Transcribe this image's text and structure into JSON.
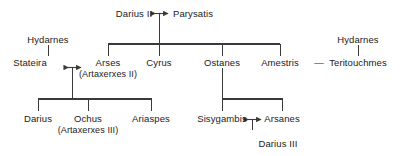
{
  "diagram": {
    "line_color": "#3a3a3a",
    "text_color": "#1a1a1a",
    "background": "#ffffff",
    "marriage_symbol": "double-headed-arrow",
    "sibling_link_symbol": "em-dash"
  },
  "people": {
    "darius_ii": "Darius II",
    "parysatis": "Parysatis",
    "hydarnes_left": "Hydarnes",
    "hydarnes_right": "Hydarnes",
    "stateira": "Stateira",
    "arses": "Arses",
    "arses_alt": "(Artaxerxes II)",
    "cyrus": "Cyrus",
    "ostanes": "Ostanes",
    "amestris": "Amestris",
    "teritouchmes": "Teritouchmes",
    "darius": "Darius",
    "ochus": "Ochus",
    "ochus_alt": "(Artaxerxes III)",
    "ariaspes": "Ariaspes",
    "sisygambis": "Sisygambis",
    "arsanes": "Arsanes",
    "darius_iii": "Darius III",
    "amestris_teritouchmes_link": "—"
  }
}
